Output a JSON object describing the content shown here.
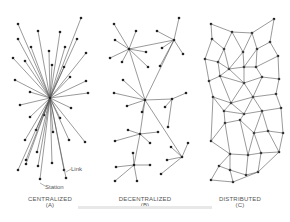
{
  "diagrams": [
    {
      "id": "centralized",
      "title": "CENTRALIZED",
      "sub": "(A)"
    },
    {
      "id": "decentralized",
      "title": "DECENTRALIZED",
      "sub": "(B)"
    },
    {
      "id": "distributed",
      "title": "DISTRIBUTED",
      "sub": "(C)"
    }
  ],
  "annotations": {
    "link": "Link",
    "station": "Station"
  },
  "colors": {
    "line": "#444444",
    "node": "#222222",
    "text": "#555555"
  }
}
